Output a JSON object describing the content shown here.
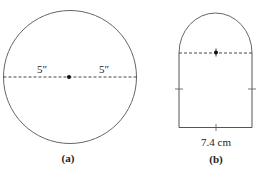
{
  "figure_a": {
    "caption": "(a)",
    "left_radius_label": "5″",
    "right_radius_label": "5″",
    "shape": "circle"
  },
  "figure_b": {
    "caption": "(b)",
    "width_label": "7.4 cm",
    "shape": "rectangle-with-semicircle-top"
  },
  "colors": {
    "stroke": "#555555",
    "background": "#ffffff"
  }
}
